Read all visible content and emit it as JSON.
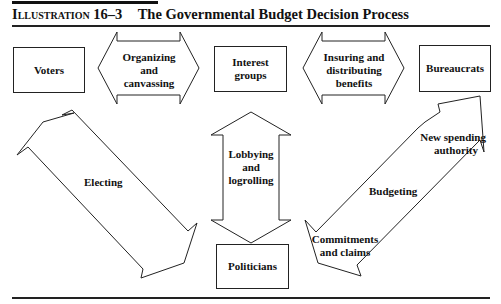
{
  "header": {
    "label": "Illustration",
    "number": "16–3",
    "title": "The Governmental Budget Decision Process"
  },
  "boxes": {
    "voters": "Voters",
    "interest_groups": "Interest groups",
    "bureaucrats": "Bureaucrats",
    "politicians": "Politicians"
  },
  "arrows": {
    "organizing": [
      "Organizing",
      "and",
      "canvassing"
    ],
    "insuring": [
      "Insuring and",
      "distributing",
      "benefits"
    ],
    "lobbying": [
      "Lobbying",
      "and",
      "logrolling"
    ],
    "electing": "Electing",
    "budgeting": "Budgeting",
    "new_spending": [
      "New spending",
      "authority"
    ],
    "commitments": [
      "Commitments",
      "and claims"
    ]
  }
}
